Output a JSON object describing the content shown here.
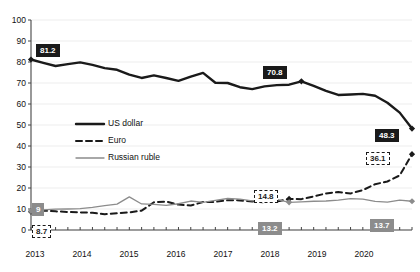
{
  "chart_data": {
    "type": "line",
    "title": "",
    "subtitle": "",
    "xlabel": "",
    "ylabel": "",
    "ylim": [
      0,
      100
    ],
    "ytick_values": [
      0,
      10,
      20,
      30,
      40,
      50,
      60,
      70,
      80,
      90,
      100
    ],
    "ytick_labels": [
      "0",
      "10",
      "20",
      "30",
      "40",
      "50",
      "60",
      "70",
      "80",
      "90",
      "100"
    ],
    "xlim": [
      "2013Q1",
      "2020Q4"
    ],
    "xtick_labels": [
      "2013",
      "2014",
      "2015",
      "2016",
      "2017",
      "2018",
      "2019",
      "2020"
    ],
    "x_minor_ticks_per_year": 4,
    "grid": "horizontal-faint",
    "legend_position": "inside-left-middle",
    "x": [
      "2013Q1",
      "2013Q2",
      "2013Q3",
      "2013Q4",
      "2014Q1",
      "2014Q2",
      "2014Q3",
      "2014Q4",
      "2015Q1",
      "2015Q2",
      "2015Q3",
      "2015Q4",
      "2016Q1",
      "2016Q2",
      "2016Q3",
      "2016Q4",
      "2017Q1",
      "2017Q2",
      "2017Q3",
      "2017Q4",
      "2018Q1",
      "2018Q2",
      "2018Q3",
      "2018Q4",
      "2019Q1",
      "2019Q2",
      "2019Q3",
      "2019Q4",
      "2020Q1",
      "2020Q2",
      "2020Q3",
      "2020Q4"
    ],
    "series": [
      {
        "name": "US dollar",
        "color": "#1a1a1a",
        "style": "solid-thick",
        "values": [
          81.2,
          79.6,
          78.1,
          79.0,
          79.8,
          78.6,
          77.1,
          76.3,
          74.0,
          72.4,
          73.6,
          72.4,
          71.0,
          73.0,
          74.8,
          70.1,
          70.0,
          68.0,
          67.1,
          68.4,
          69.0,
          69.2,
          70.8,
          68.6,
          66.2,
          64.3,
          64.5,
          64.8,
          63.9,
          60.6,
          55.9,
          48.3
        ]
      },
      {
        "name": "Euro",
        "color": "#1a1a1a",
        "style": "dashed",
        "values": [
          8.7,
          9.2,
          8.9,
          8.6,
          8.4,
          8.2,
          7.5,
          8.0,
          8.4,
          9.2,
          13.2,
          13.5,
          12.1,
          11.7,
          13.3,
          13.4,
          14.2,
          14.1,
          13.6,
          13.2,
          13.6,
          14.8,
          14.7,
          16.0,
          17.4,
          18.1,
          17.4,
          19.0,
          21.8,
          23.1,
          26.0,
          36.1
        ]
      },
      {
        "name": "Russian ruble",
        "color": "#8c8c8c",
        "style": "solid-thin",
        "values": [
          9.0,
          9.6,
          9.9,
          10.0,
          10.2,
          10.8,
          11.6,
          12.3,
          15.8,
          12.4,
          12.2,
          11.7,
          12.5,
          13.8,
          13.2,
          14.1,
          15.0,
          14.7,
          13.9,
          14.8,
          14.6,
          13.2,
          13.4,
          13.7,
          13.8,
          14.2,
          14.9,
          14.7,
          13.6,
          13.3,
          14.2,
          13.7
        ]
      }
    ],
    "callouts": [
      {
        "series": "US dollar",
        "label": "81.2",
        "x": "2013Q1",
        "value": 81.2
      },
      {
        "series": "US dollar",
        "label": "70.8",
        "x": "2018Q3",
        "value": 70.8
      },
      {
        "series": "US dollar",
        "label": "48.3",
        "x": "2020Q4",
        "value": 48.3
      },
      {
        "series": "Euro",
        "label": "8.7",
        "x": "2013Q1",
        "value": 8.7
      },
      {
        "series": "Euro",
        "label": "14.8",
        "x": "2018Q2",
        "value": 14.8
      },
      {
        "series": "Euro",
        "label": "36.1",
        "x": "2020Q4",
        "value": 36.1
      },
      {
        "series": "Russian ruble",
        "label": "9",
        "x": "2013Q1",
        "value": 9.0
      },
      {
        "series": "Russian ruble",
        "label": "13.2",
        "x": "2018Q2",
        "value": 13.2
      },
      {
        "series": "Russian ruble",
        "label": "13.7",
        "x": "2020Q4",
        "value": 13.7
      }
    ]
  },
  "axis": {
    "y_labels": [
      "100",
      "90",
      "80",
      "70",
      "60",
      "50",
      "40",
      "30",
      "20",
      "10",
      "0"
    ],
    "x_labels": [
      "2013",
      "2014",
      "2015",
      "2016",
      "2017",
      "2018",
      "2019",
      "2020"
    ]
  },
  "legend": {
    "items": [
      {
        "label": "US dollar"
      },
      {
        "label": "Euro"
      },
      {
        "label": "Russian ruble"
      }
    ]
  },
  "callout_text": {
    "usd_start": "81.2",
    "usd_mid": "70.8",
    "usd_end": "48.3",
    "eur_start": "8.7",
    "eur_mid": "14.8",
    "eur_end": "36.1",
    "rub_start": "9",
    "rub_mid": "13.2",
    "rub_end": "13.7"
  },
  "colors": {
    "usd": "#1a1a1a",
    "eur": "#1a1a1a",
    "rub": "#8c8c8c",
    "axis": "#444444",
    "grid": "#ededed",
    "background": "#ffffff"
  }
}
